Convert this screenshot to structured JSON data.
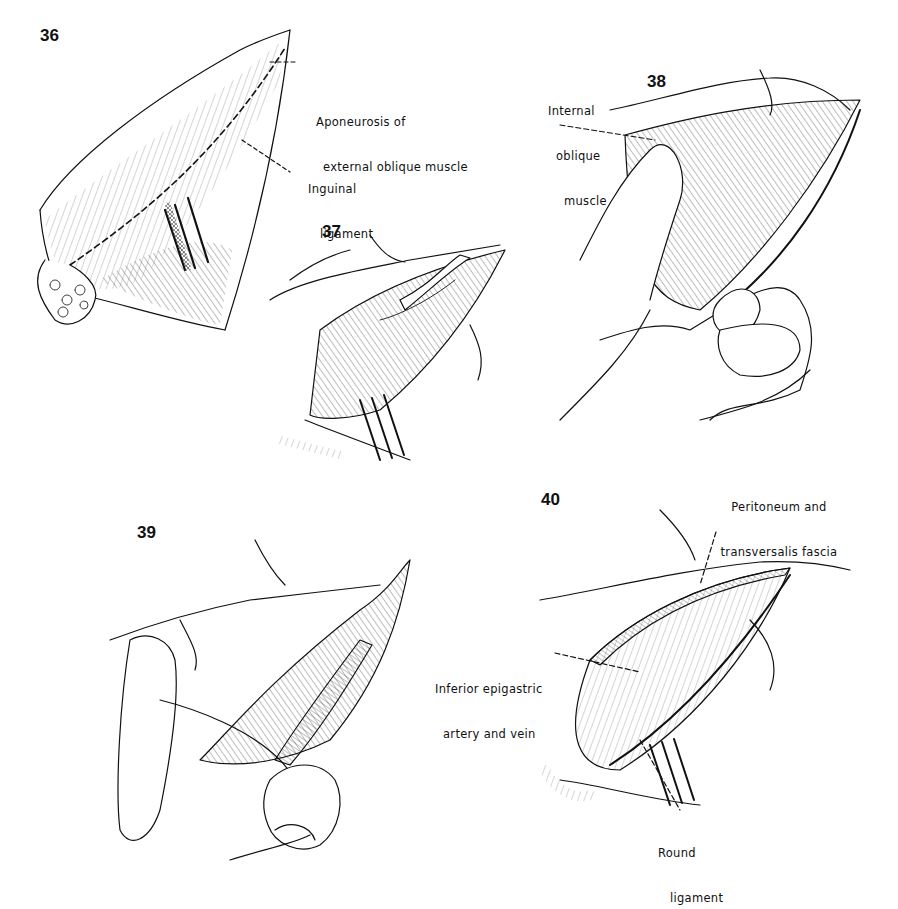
{
  "figures": [
    {
      "number": "36",
      "labels": [
        {
          "lines": [
            "Aponeurosis of",
            "external oblique muscle"
          ]
        },
        {
          "lines": [
            "Inguinal",
            "ligament"
          ]
        }
      ]
    },
    {
      "number": "37",
      "labels": []
    },
    {
      "number": "38",
      "labels": [
        {
          "lines": [
            "Internal",
            "oblique",
            "muscle"
          ]
        }
      ]
    },
    {
      "number": "39",
      "labels": []
    },
    {
      "number": "40",
      "labels": [
        {
          "lines": [
            "Peritoneum and",
            "transversalis fascia"
          ]
        },
        {
          "lines": [
            "Inferior epigastric",
            "artery and vein"
          ]
        },
        {
          "lines": [
            "Round",
            "ligament"
          ]
        }
      ]
    }
  ],
  "colors": {
    "ink": "#111111",
    "background": "#ffffff"
  }
}
